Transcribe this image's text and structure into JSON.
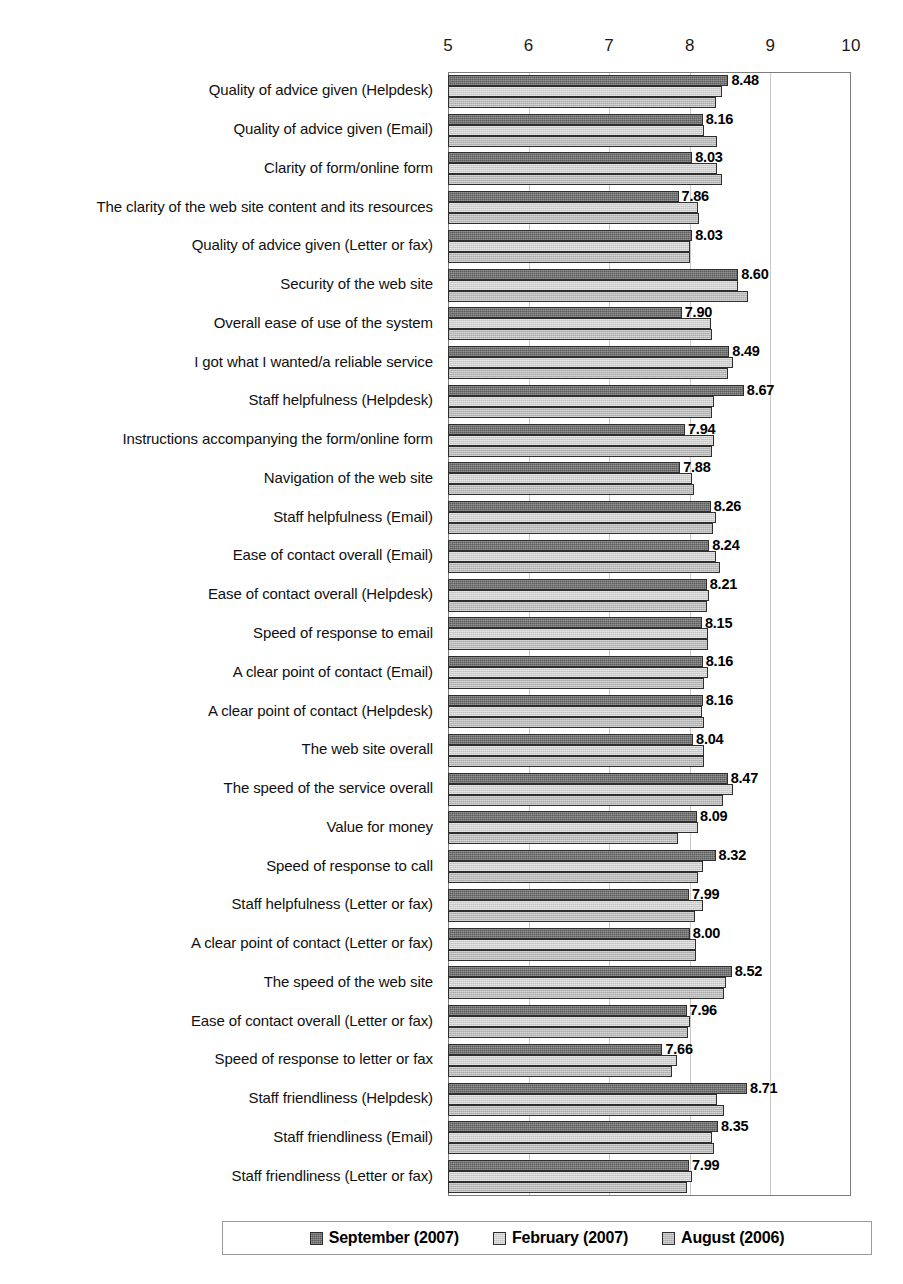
{
  "chart_data": {
    "type": "bar",
    "orientation": "horizontal",
    "title": "",
    "xlabel": "",
    "ylabel": "",
    "xlim": [
      5,
      10
    ],
    "xticks": [
      5,
      6,
      7,
      8,
      9,
      10
    ],
    "grid": true,
    "legend_position": "bottom",
    "value_label_series": "September (2007)",
    "series": [
      {
        "name": "September (2007)",
        "color": "#5c5c5c",
        "values": [
          8.48,
          8.16,
          8.03,
          7.86,
          8.03,
          8.6,
          7.9,
          8.49,
          8.67,
          7.94,
          7.88,
          8.26,
          8.24,
          8.21,
          8.15,
          8.16,
          8.16,
          8.04,
          8.47,
          8.09,
          8.32,
          7.99,
          8.0,
          8.52,
          7.96,
          7.66,
          8.71,
          8.35,
          7.99
        ]
      },
      {
        "name": "February (2007)",
        "color": "#cfcfcf",
        "values": [
          8.4,
          8.18,
          8.34,
          8.1,
          8.0,
          8.6,
          8.26,
          8.53,
          8.3,
          8.3,
          8.03,
          8.32,
          8.33,
          8.24,
          8.22,
          8.22,
          8.15,
          8.17,
          8.53,
          8.1,
          8.16,
          8.16,
          8.08,
          8.45,
          8.0,
          7.84,
          8.34,
          8.27,
          8.03
        ]
      },
      {
        "name": "August (2006)",
        "color": "#b9b9b9",
        "values": [
          8.32,
          8.34,
          8.4,
          8.12,
          8.0,
          8.72,
          8.28,
          8.47,
          8.27,
          8.27,
          8.05,
          8.29,
          8.38,
          8.21,
          8.22,
          8.18,
          8.17,
          8.18,
          8.41,
          7.85,
          8.1,
          8.07,
          8.08,
          8.42,
          7.98,
          7.78,
          8.42,
          8.3,
          7.97
        ]
      }
    ],
    "categories": [
      "Quality of advice given (Helpdesk)",
      "Quality of advice given (Email)",
      "Clarity of form/online form",
      "The clarity of the web site content and its resources",
      "Quality of advice given (Letter or fax)",
      "Security of the web site",
      "Overall ease of use of the system",
      "I got what I wanted/a reliable service",
      "Staff helpfulness (Helpdesk)",
      "Instructions accompanying the form/online form",
      "Navigation of the web site",
      "Staff helpfulness (Email)",
      "Ease of contact overall (Email)",
      "Ease of contact overall (Helpdesk)",
      "Speed of response to email",
      "A clear point of contact (Email)",
      "A clear point of contact (Helpdesk)",
      "The web site overall",
      "The speed of the service overall",
      "Value for money",
      "Speed of response to call",
      "Staff helpfulness (Letter or fax)",
      "A clear point of contact (Letter or fax)",
      "The speed of the web site",
      "Ease of contact overall (Letter or fax)",
      "Speed of response to letter or fax",
      "Staff friendliness (Helpdesk)",
      "Staff friendliness (Email)",
      "Staff friendliness (Letter or fax)"
    ],
    "value_labels": [
      "8.48",
      "8.16",
      "8.03",
      "7.86",
      "8.03",
      "8.60",
      "7.90",
      "8.49",
      "8.67",
      "7.94",
      "7.88",
      "8.26",
      "8.24",
      "8.21",
      "8.15",
      "8.16",
      "8.16",
      "8.04",
      "8.47",
      "8.09",
      "8.32",
      "7.99",
      "8.00",
      "8.52",
      "7.96",
      "7.66",
      "8.71",
      "8.35",
      "7.99"
    ],
    "xtick_labels": [
      "5",
      "6",
      "7",
      "8",
      "9",
      "10"
    ]
  },
  "legend": {
    "entries": [
      {
        "label": "September (2007)"
      },
      {
        "label": "February (2007)"
      },
      {
        "label": "August (2006)"
      }
    ]
  }
}
